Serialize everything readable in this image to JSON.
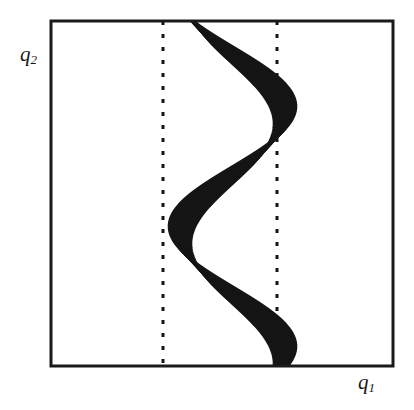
{
  "figure": {
    "name": "phase-space-sinusoid-bundle",
    "background_color": "#ffffff",
    "ink_color": "#151515",
    "frame": {
      "x": 51,
      "y": 21,
      "width": 342,
      "height": 345,
      "line_width": 3,
      "color": "#1a1a1a"
    },
    "axes": {
      "y_label": "q",
      "y_label_sub": "2",
      "x_label": "q",
      "x_label_sub": "1"
    },
    "dotted_lines": [
      {
        "name": "left-dotted-reference-line",
        "x": 163,
        "y_top": 21,
        "y_bottom": 366,
        "dash": 4,
        "gap": 9,
        "width": 3
      },
      {
        "name": "right-dotted-reference-line",
        "x": 277,
        "y_top": 21,
        "y_bottom": 366,
        "dash": 4,
        "gap": 9,
        "width": 3
      }
    ]
  },
  "chart_data": {
    "type": "line",
    "title": "",
    "xlabel": "q1",
    "ylabel": "q2",
    "grid": false,
    "legend": false,
    "xlim": [
      51,
      393
    ],
    "ylim": [
      21,
      366
    ],
    "n_curves": 17,
    "node_points": [
      {
        "x": 285,
        "y": 115
      },
      {
        "x": 180,
        "y": 235
      },
      {
        "x": 285,
        "y": 355
      }
    ],
    "bundle_extent_at_top": {
      "x_min": 163,
      "x_max": 285
    },
    "series": [
      {
        "name": "curve-base",
        "center_x": 224,
        "amplitude": 62,
        "wavelength": 240,
        "phase_deg": 0
      },
      {
        "name": "curve-spread",
        "amplitude_spread": 22,
        "phase_spread_deg": 26
      }
    ],
    "curve_sample_x": [
      163,
      180,
      200,
      224,
      250,
      277,
      285
    ],
    "curve_sample_y": [
      21,
      115,
      160,
      235,
      300,
      355,
      366
    ]
  }
}
